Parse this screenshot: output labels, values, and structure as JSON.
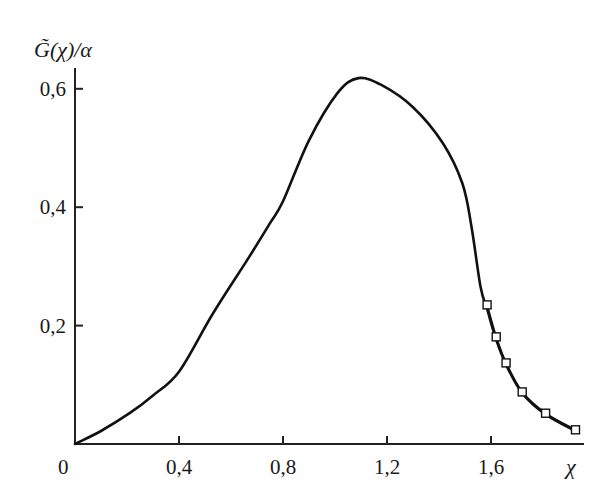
{
  "chart_data": {
    "type": "line",
    "title": "",
    "xlabel": "χ",
    "ylabel": "G̃(χ)/α",
    "xlim": [
      0,
      1.95
    ],
    "ylim": [
      0,
      0.64
    ],
    "grid": false,
    "legend": null,
    "x_ticks": [
      {
        "value": 0,
        "label": "0"
      },
      {
        "value": 0.4,
        "label": "0,4"
      },
      {
        "value": 0.8,
        "label": "0,8"
      },
      {
        "value": 1.2,
        "label": "1,2"
      },
      {
        "value": 1.6,
        "label": "1,6"
      }
    ],
    "y_ticks": [
      {
        "value": 0.2,
        "label": "0,2"
      },
      {
        "value": 0.4,
        "label": "0,4"
      },
      {
        "value": 0.6,
        "label": "0,6"
      }
    ],
    "series": [
      {
        "name": "curve",
        "style": "solid",
        "color": "#111111",
        "x": [
          0,
          0.1,
          0.21,
          0.3,
          0.4,
          0.53,
          0.67,
          0.75,
          0.8,
          0.9,
          1.01,
          1.09,
          1.18,
          1.3,
          1.415,
          1.49,
          1.525,
          1.56,
          1.585,
          1.62,
          1.658,
          1.72,
          1.81,
          1.925
        ],
        "y": [
          0,
          0.022,
          0.052,
          0.082,
          0.122,
          0.22,
          0.316,
          0.373,
          0.41,
          0.513,
          0.593,
          0.618,
          0.606,
          0.569,
          0.508,
          0.44,
          0.367,
          0.265,
          0.228,
          0.176,
          0.134,
          0.086,
          0.05,
          0.022
        ]
      },
      {
        "name": "markers",
        "style": "open-square",
        "color": "#111111",
        "x": [
          1.585,
          1.62,
          1.658,
          1.72,
          1.81,
          1.925
        ],
        "y": [
          0.235,
          0.181,
          0.137,
          0.088,
          0.052,
          0.024
        ]
      }
    ]
  }
}
